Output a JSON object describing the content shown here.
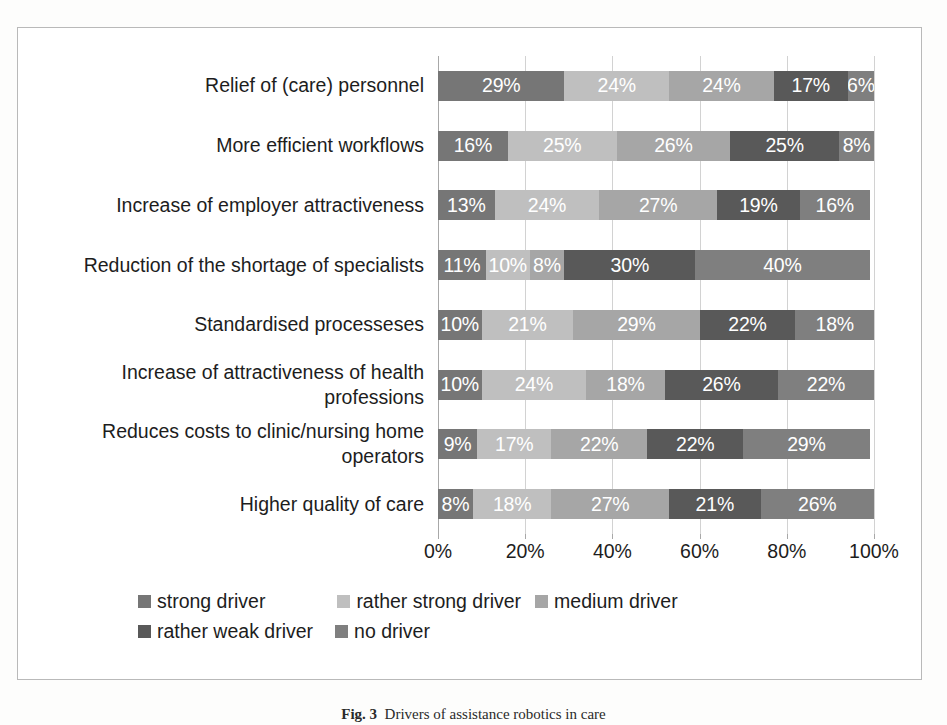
{
  "chart_data": {
    "type": "bar",
    "subtype": "stacked-horizontal-100-percent",
    "title": "",
    "xlabel": "",
    "ylabel": "",
    "xlim": [
      0,
      100
    ],
    "xticks": [
      "0%",
      "20%",
      "40%",
      "60%",
      "80%",
      "100%"
    ],
    "xtick_values": [
      0,
      20,
      40,
      60,
      80,
      100
    ],
    "grid": true,
    "legend_position": "bottom",
    "categories": [
      "Relief of (care) personnel",
      "More efficient workflows",
      "Increase of employer attractiveness",
      "Reduction of the shortage of specialists",
      "Standardised processeses",
      "Increase of attractiveness of health professions",
      "Reduces costs to clinic/nursing home operators",
      "Higher quality of care"
    ],
    "series": [
      {
        "name": "strong driver",
        "color": "#767676",
        "values": [
          29,
          16,
          13,
          11,
          10,
          10,
          9,
          8
        ],
        "labels": [
          "29%",
          "16%",
          "13%",
          "11%",
          "10%",
          "10%",
          "9%",
          "8%"
        ]
      },
      {
        "name": "rather strong driver",
        "color": "#bfbfbf",
        "values": [
          24,
          25,
          24,
          10,
          21,
          24,
          17,
          18
        ],
        "labels": [
          "24%",
          "25%",
          "24%",
          "10%",
          "21%",
          "24%",
          "17%",
          "18%"
        ]
      },
      {
        "name": "medium driver",
        "color": "#a6a6a6",
        "values": [
          24,
          26,
          27,
          8,
          29,
          18,
          22,
          27
        ],
        "labels": [
          "24%",
          "26%",
          "27%",
          "8%",
          "29%",
          "18%",
          "22%",
          "27%"
        ]
      },
      {
        "name": "rather weak driver",
        "color": "#595959",
        "values": [
          17,
          25,
          19,
          30,
          22,
          26,
          22,
          21
        ],
        "labels": [
          "17%",
          "25%",
          "19%",
          "30%",
          "22%",
          "26%",
          "22%",
          "21%"
        ]
      },
      {
        "name": "no driver",
        "color": "#7f7f7f",
        "values": [
          6,
          8,
          16,
          40,
          18,
          22,
          29,
          26
        ],
        "labels": [
          "6%",
          "8%",
          "16%",
          "40%",
          "18%",
          "22%",
          "29%",
          "26%"
        ]
      }
    ]
  },
  "legend": {
    "row1": [
      {
        "label": "strong driver",
        "color": "#767676"
      },
      {
        "label": "rather strong driver",
        "color": "#bfbfbf"
      },
      {
        "label": "medium driver",
        "color": "#a6a6a6"
      }
    ],
    "row2": [
      {
        "label": "rather weak driver",
        "color": "#595959"
      },
      {
        "label": "no driver",
        "color": "#7f7f7f"
      }
    ]
  },
  "caption": {
    "figure_number": "Fig. 3",
    "text": "Drivers of assistance robotics in care"
  }
}
